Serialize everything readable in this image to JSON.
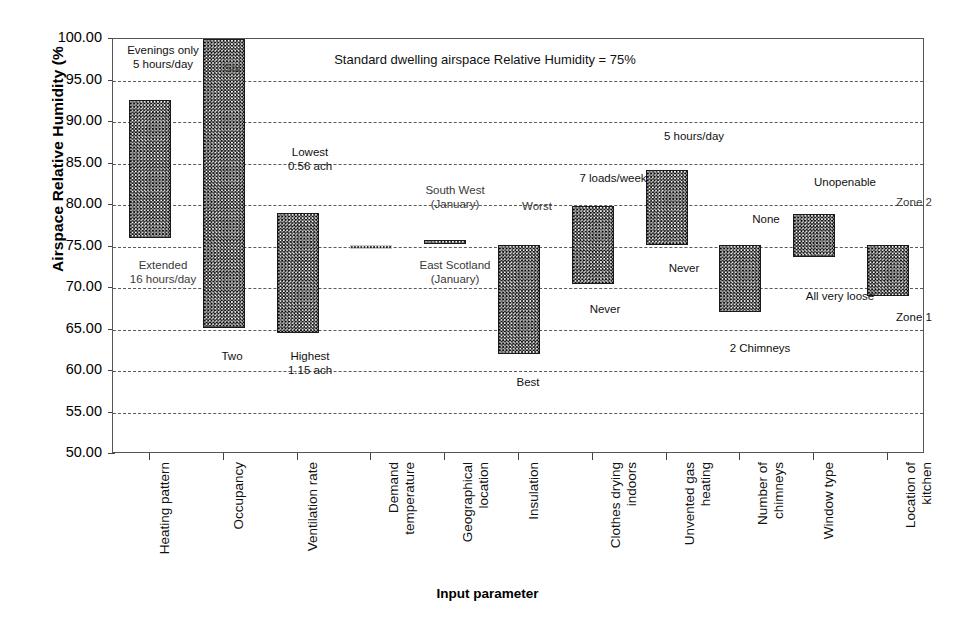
{
  "chart_data": {
    "type": "bar",
    "title": "Standard dwelling airspace Relative Humidity = 75%",
    "xlabel": "Input parameter",
    "ylabel": "Airspace Relative Humidity (%",
    "ylim": [
      50.0,
      100.0
    ],
    "ytick_labels": [
      "100.00",
      "95.00",
      "90.00",
      "85.00",
      "80.00",
      "75.00",
      "70.00",
      "65.00",
      "60.00",
      "55.00",
      "50.00"
    ],
    "ytick_values": [
      100,
      95,
      90,
      85,
      80,
      75,
      70,
      65,
      60,
      55,
      50
    ],
    "grid": true,
    "legend": "none",
    "baseline": 75,
    "categories": [
      "Heating pattern",
      "Occupancy",
      "Ventilation rate",
      "Demand\ntemperature",
      "Geographical\nlocation",
      "Insulation",
      "Clothes drying\nindoors",
      "Unvented gas\nheating",
      "Number of\nchimneys",
      "Window type",
      "Location of\nkitchen"
    ],
    "bars": [
      {
        "category": "Heating pattern",
        "high": 92.7,
        "low": 76.0,
        "faint": false
      },
      {
        "category": "Occupancy",
        "high": 100.0,
        "low": 65.2,
        "faint": false
      },
      {
        "category": "Ventilation rate",
        "high": 79.0,
        "low": 64.6,
        "faint": false
      },
      {
        "category": "Demand temperature",
        "high": 75.2,
        "low": 75.0,
        "faint": true
      },
      {
        "category": "Geographical location",
        "high": 75.8,
        "low": 75.3,
        "faint": false
      },
      {
        "category": "Insulation",
        "high": 75.2,
        "low": 62.0,
        "faint": false
      },
      {
        "category": "Clothes drying indoors",
        "high": 79.9,
        "low": 70.5,
        "faint": false
      },
      {
        "category": "Unvented gas heating",
        "high": 84.2,
        "low": 75.2,
        "faint": false
      },
      {
        "category": "Number of chimneys",
        "high": 75.2,
        "low": 67.1,
        "faint": false
      },
      {
        "category": "Window type",
        "high": 78.9,
        "low": 73.7,
        "faint": false
      },
      {
        "category": "Location of kitchen",
        "high": 75.2,
        "low": 69.0,
        "faint": false
      }
    ],
    "annotations": [
      {
        "id": "heating-high",
        "text": "Evenings only\n5 hours/day",
        "x": 163,
        "y": 44,
        "faded": false
      },
      {
        "id": "heating-low",
        "text": "Extended\n16 hours/day",
        "x": 163,
        "y": 259,
        "faded": true
      },
      {
        "id": "occupancy-high",
        "text": "Six",
        "x": 232,
        "y": 62,
        "faded": true
      },
      {
        "id": "occupancy-low",
        "text": "Two",
        "x": 232,
        "y": 350,
        "faded": false
      },
      {
        "id": "ventilation-high",
        "text": "Lowest\n0.56 ach",
        "x": 310,
        "y": 146,
        "faded": false
      },
      {
        "id": "ventilation-low",
        "text": "Highest\n1.15 ach",
        "x": 310,
        "y": 350,
        "faded": false
      },
      {
        "id": "geographical-high",
        "text": "South West\n(January)",
        "x": 455,
        "y": 184,
        "faded": true
      },
      {
        "id": "geographical-low",
        "text": "East Scotland\n(January)",
        "x": 455,
        "y": 259,
        "faded": true
      },
      {
        "id": "insulation-high",
        "text": "Worst",
        "x": 537,
        "y": 200,
        "faded": true
      },
      {
        "id": "insulation-low",
        "text": "Best",
        "x": 528,
        "y": 376,
        "faded": false
      },
      {
        "id": "clothes-high",
        "text": "7 loads/week",
        "x": 613,
        "y": 172,
        "faded": false
      },
      {
        "id": "clothes-low",
        "text": "Never",
        "x": 605,
        "y": 303,
        "faded": false
      },
      {
        "id": "unvented-high",
        "text": "5 hours/day",
        "x": 694,
        "y": 130,
        "faded": false
      },
      {
        "id": "unvented-low",
        "text": "Never",
        "x": 684,
        "y": 262,
        "faded": false
      },
      {
        "id": "chimneys-high",
        "text": "None",
        "x": 766,
        "y": 213,
        "faded": false
      },
      {
        "id": "chimneys-low",
        "text": "2 Chimneys",
        "x": 760,
        "y": 342,
        "faded": false
      },
      {
        "id": "window-high",
        "text": "Unopenable",
        "x": 845,
        "y": 176,
        "faded": false
      },
      {
        "id": "window-low",
        "text": "All very loose",
        "x": 840,
        "y": 290,
        "faded": false
      },
      {
        "id": "kitchen-high",
        "text": "Zone 2",
        "x": 914,
        "y": 196,
        "faded": true
      },
      {
        "id": "kitchen-low",
        "text": "Zone 1",
        "x": 914,
        "y": 311,
        "faded": false
      }
    ]
  }
}
